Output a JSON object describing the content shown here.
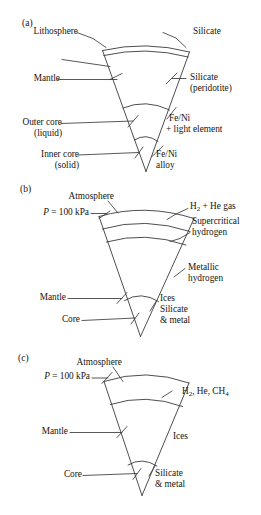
{
  "figure": {
    "background_color": "#ffffff",
    "line_color": "#3a3a3a",
    "text_color": "#141414"
  },
  "panels": [
    {
      "tag": "(a)",
      "type": "terrestrial-planet",
      "labels_left": [
        {
          "name": "lithosphere",
          "text": "Lithosphere"
        },
        {
          "name": "mantle",
          "text": "Mantle"
        },
        {
          "name": "outer-core-line1",
          "text": "Outer core"
        },
        {
          "name": "outer-core-line2",
          "text": "(liquid)"
        },
        {
          "name": "inner-core-line1",
          "text": "Inner core"
        },
        {
          "name": "inner-core-line2",
          "text": "(solid)"
        }
      ],
      "labels_right": [
        {
          "name": "silicate",
          "text": "Silicate"
        },
        {
          "name": "silicate-peridotite-line1",
          "text": "Silicate"
        },
        {
          "name": "silicate-peridotite-line2",
          "text": "(peridotite)"
        },
        {
          "name": "feni-light-line1",
          "text": "Fe/Ni"
        },
        {
          "name": "feni-light-line2",
          "text": "+ light element"
        },
        {
          "name": "feni-alloy-line1",
          "text": "Fe/Ni"
        },
        {
          "name": "feni-alloy-line2",
          "text": "alloy"
        }
      ]
    },
    {
      "tag": "(b)",
      "type": "gas-giant",
      "labels_left": [
        {
          "name": "atmosphere",
          "text": "Atmosphere"
        },
        {
          "name": "pressure",
          "text": "P = 100 kPa",
          "italic_symbol": "P",
          "rest": " = 100 kPa"
        },
        {
          "name": "mantle",
          "text": "Mantle"
        },
        {
          "name": "core",
          "text": "Core"
        }
      ],
      "labels_right": [
        {
          "name": "h2-he-gas",
          "text": "H2 + He gas",
          "formula_prefix": "H",
          "formula_sub": "2",
          "formula_suffix": " + He gas"
        },
        {
          "name": "supercritical-line1",
          "text": "Supercritical"
        },
        {
          "name": "supercritical-line2",
          "text": "hydrogen"
        },
        {
          "name": "metallic-line1",
          "text": "Metallic"
        },
        {
          "name": "metallic-line2",
          "text": "hydrogen"
        },
        {
          "name": "core-comp-line1",
          "text": "Ices"
        },
        {
          "name": "core-comp-line2",
          "text": "Silicate"
        },
        {
          "name": "core-comp-line3",
          "text": "& metal"
        }
      ]
    },
    {
      "tag": "(c)",
      "type": "ice-giant",
      "labels_left": [
        {
          "name": "atmosphere",
          "text": "Atmosphere"
        },
        {
          "name": "pressure",
          "text": "P = 100 kPa",
          "italic_symbol": "P",
          "rest": " = 100 kPa"
        },
        {
          "name": "mantle",
          "text": "Mantle"
        },
        {
          "name": "core",
          "text": "Core"
        }
      ],
      "labels_right": [
        {
          "name": "h2-he-ch4",
          "text": "H2, He, CH4",
          "part1_prefix": "H",
          "part1_sub": "2",
          "part1_mid": ", He, CH",
          "part1_sub2": "4"
        },
        {
          "name": "ices",
          "text": "Ices"
        },
        {
          "name": "core-comp-line1",
          "text": "Silicate"
        },
        {
          "name": "core-comp-line2",
          "text": "& metal"
        }
      ]
    }
  ]
}
